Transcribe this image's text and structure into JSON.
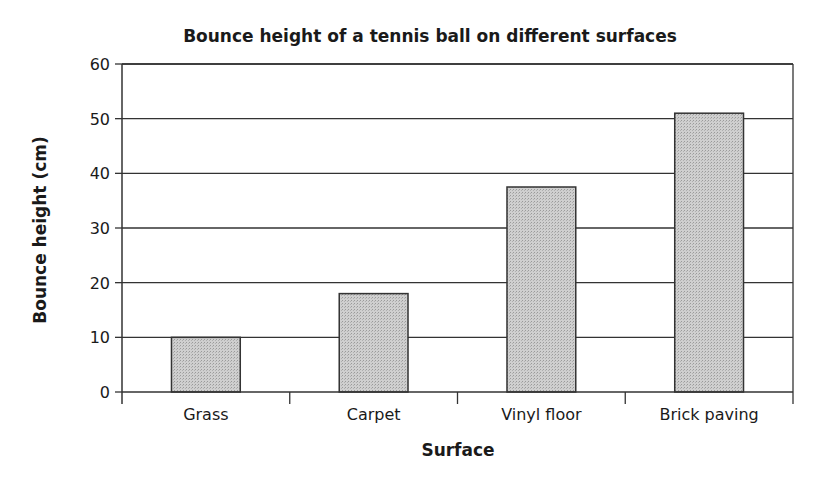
{
  "chart_data": {
    "type": "bar",
    "title": "Bounce height of a tennis ball on different surfaces",
    "xlabel": "Surface",
    "ylabel": "Bounce height (cm)",
    "categories": [
      "Grass",
      "Carpet",
      "Vinyl floor",
      "Brick paving"
    ],
    "values": [
      10,
      18,
      37.5,
      51
    ],
    "ylim": [
      0,
      60
    ],
    "yticks": [
      0,
      10,
      20,
      30,
      40,
      50,
      60
    ],
    "grid": true,
    "legend": null,
    "bar_fill": "#c8c8c8",
    "bar_stroke": "#333333"
  }
}
